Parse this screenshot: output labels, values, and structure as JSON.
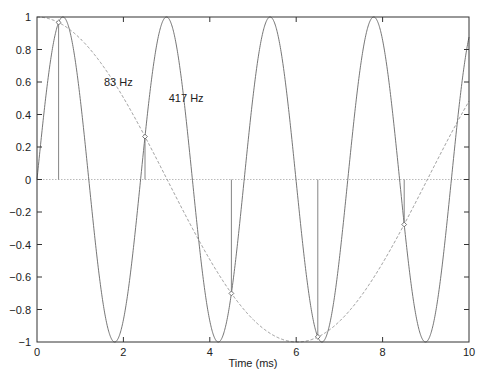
{
  "chart_data": {
    "type": "line",
    "title": "",
    "xlabel": "Time (ms)",
    "ylabel": "",
    "xlim": [
      0,
      10
    ],
    "ylim": [
      -1,
      1
    ],
    "grid": false,
    "legend": null,
    "x_ticks": [
      0,
      2,
      4,
      6,
      8,
      10
    ],
    "x_tick_labels": [
      "0",
      "2",
      "4",
      "6",
      "8",
      "10"
    ],
    "y_ticks": [
      1,
      0.8,
      0.6,
      0.4,
      0.2,
      0,
      -0.2,
      -0.4,
      -0.6,
      -0.8,
      -1
    ],
    "y_tick_labels": [
      "1",
      "0.8",
      "0.6",
      "0.4",
      "0.2",
      "0",
      "−0.2",
      "−0.4",
      "−0.6",
      "−0.8",
      "−1"
    ],
    "series": [
      {
        "name": "417 Hz",
        "style": "solid",
        "function": "sin(2*pi*0.417*t)",
        "frequency_khz": 0.417,
        "phase": "sine"
      },
      {
        "name": "83 Hz",
        "style": "dashed",
        "function": "cos(2*pi*0.083*t)",
        "frequency_khz": 0.083,
        "phase": "cosine"
      },
      {
        "name": "samples",
        "style": "stem",
        "x": [
          0.5,
          2.5,
          4.5,
          6.5,
          8.5
        ],
        "values": [
          0.966,
          0.264,
          -0.701,
          -0.968,
          -0.277
        ]
      }
    ],
    "annotations": [
      {
        "text": "83 Hz",
        "x": 1.55,
        "y": 0.6
      },
      {
        "text": "417 Hz",
        "x": 3.05,
        "y": 0.5
      }
    ]
  }
}
